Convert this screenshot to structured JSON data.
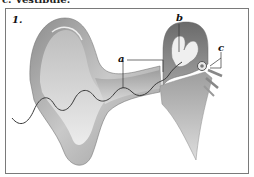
{
  "caption": {
    "text": "c. Vestibule."
  },
  "figure": {
    "number": "1.",
    "labels": {
      "a": "a",
      "b": "b",
      "c": "c"
    },
    "colors": {
      "frame": "#7a7a7a",
      "tissue_light": "#d9d9d9",
      "tissue_mid": "#a8a8a8",
      "tissue_dark": "#6e6e6e",
      "nerve_line": "#3a3a3a"
    }
  }
}
